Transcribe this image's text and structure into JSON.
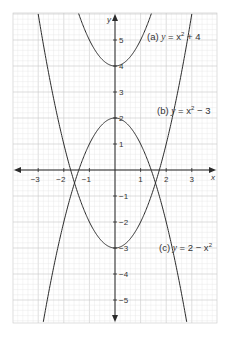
{
  "chart_data": {
    "type": "line",
    "title": "",
    "xlabel": "x",
    "ylabel": "y",
    "xlim": [
      -3.9,
      4.0
    ],
    "ylim": [
      -5.9,
      6.0
    ],
    "grid": true,
    "legend_position": "inline annotations",
    "x_ticks": [
      -3,
      -2,
      -1,
      1,
      2,
      3
    ],
    "x_tick_labels": [
      "−3",
      "−2",
      "−1",
      "1",
      "2",
      "3"
    ],
    "y_ticks": [
      5,
      4,
      3,
      2,
      1,
      -1,
      -2,
      -3,
      -4,
      -5
    ],
    "y_tick_labels": [
      "5",
      "4",
      "3",
      "2",
      "1",
      "−1",
      "−2",
      "−3",
      "−4",
      "−5"
    ],
    "series": [
      {
        "name": "(a) y = x² + 4",
        "label_prefix": "(a)",
        "expression": "x^2 + 4",
        "a": 1,
        "c": 4,
        "points": [
          [
            -2,
            8
          ],
          [
            -1,
            5
          ],
          [
            0,
            4
          ],
          [
            1,
            5
          ],
          [
            2,
            8
          ]
        ]
      },
      {
        "name": "(b) y = x² − 3",
        "label_prefix": "(b)",
        "expression": "x^2 - 3",
        "a": 1,
        "c": -3,
        "points": [
          [
            -3,
            6
          ],
          [
            -2,
            1
          ],
          [
            -1,
            -2
          ],
          [
            0,
            -3
          ],
          [
            1,
            -2
          ],
          [
            2,
            1
          ],
          [
            3,
            6
          ]
        ]
      },
      {
        "name": "(c) y = 2 − x²",
        "label_prefix": "(c)",
        "expression": "2 - x^2",
        "a": -1,
        "c": 2,
        "points": [
          [
            -3,
            -7
          ],
          [
            -2,
            -2
          ],
          [
            -1,
            1
          ],
          [
            0,
            2
          ],
          [
            1,
            1
          ],
          [
            2,
            -2
          ],
          [
            3,
            -7
          ]
        ]
      }
    ],
    "annotations": [
      {
        "text": "(a) y = x² + 4",
        "near": [
          0.9,
          5.2
        ]
      },
      {
        "text": "(b) y = x² − 3",
        "near": [
          1.8,
          2.3
        ]
      },
      {
        "text": "(c) y = 2 − x²",
        "near": [
          1.8,
          -3.2
        ]
      }
    ]
  },
  "labels": {
    "x_axis": "x",
    "y_axis": "y",
    "eq_a_prefix": "(a) ",
    "eq_a_rest": " = x",
    "eq_a_tail": " + 4",
    "eq_b_prefix": "(b) ",
    "eq_b_rest": " = x",
    "eq_b_tail": " − 3",
    "eq_c_prefix": "(c) ",
    "eq_c_tail": " = 2 − x",
    "var_y": "y",
    "sup2": "2"
  },
  "colors": {
    "curve": "#2b2b2b",
    "axis": "#2b2b2b",
    "grid_minor": "#e6e6e6",
    "grid_major": "#c8c8c8",
    "text": "#333333"
  }
}
